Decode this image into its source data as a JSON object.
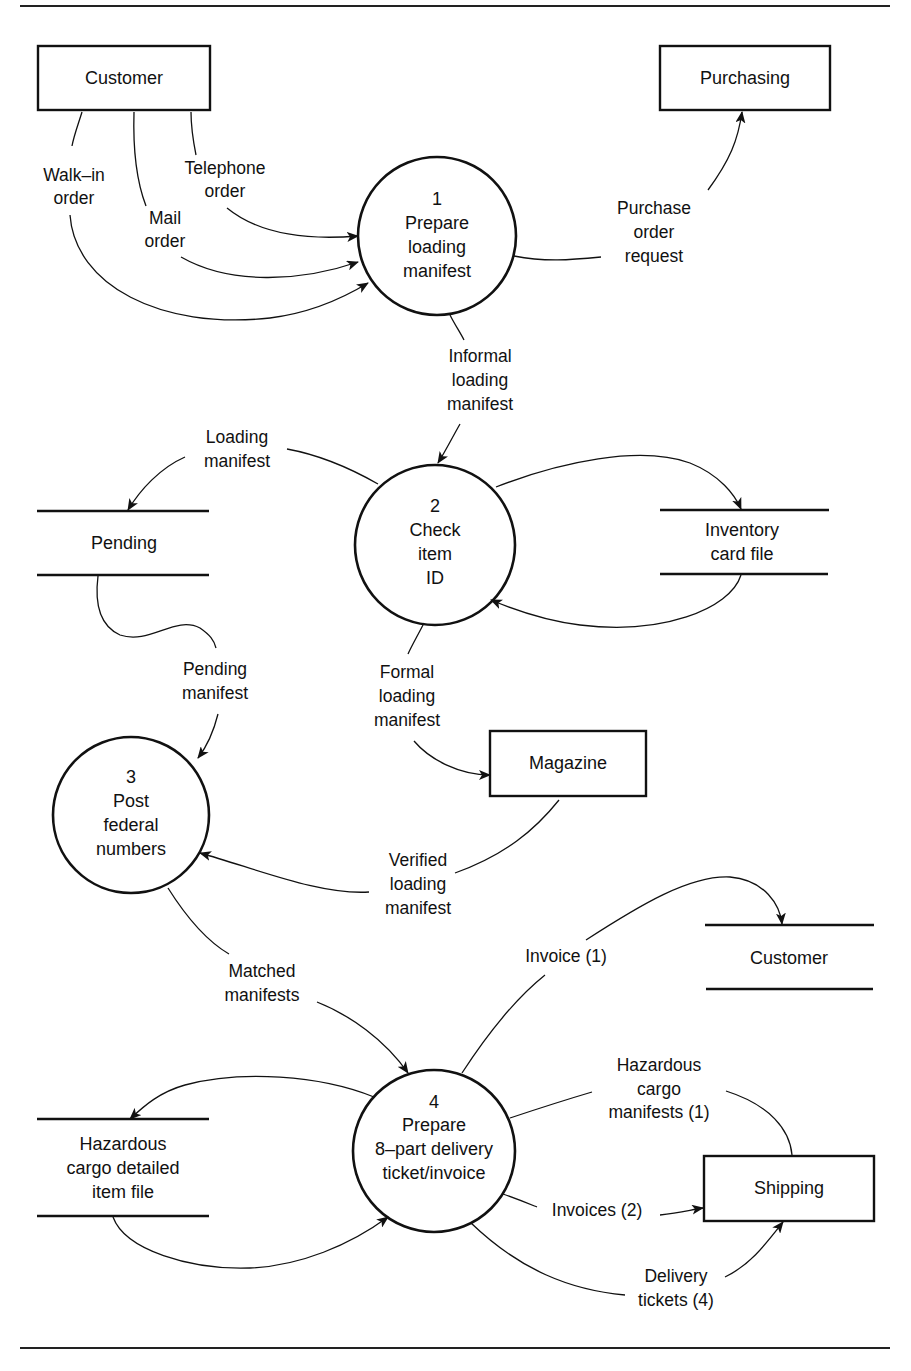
{
  "diagram": {
    "type": "data-flow-diagram",
    "external_entities": [
      {
        "id": "customer_entity",
        "label": "Customer"
      },
      {
        "id": "purchasing",
        "label": "Purchasing"
      },
      {
        "id": "magazine",
        "label": "Magazine"
      },
      {
        "id": "shipping",
        "label": "Shipping"
      }
    ],
    "processes": [
      {
        "id": "p1",
        "number": "1",
        "lines": [
          "Prepare",
          "loading",
          "manifest"
        ]
      },
      {
        "id": "p2",
        "number": "2",
        "lines": [
          "Check",
          "item",
          "ID"
        ]
      },
      {
        "id": "p3",
        "number": "3",
        "lines": [
          "Post",
          "federal",
          "numbers"
        ]
      },
      {
        "id": "p4",
        "number": "4",
        "lines": [
          "Prepare",
          "8–part delivery",
          "ticket/invoice"
        ]
      }
    ],
    "data_stores": [
      {
        "id": "pending",
        "lines": [
          "Pending"
        ]
      },
      {
        "id": "inventory",
        "lines": [
          "Inventory",
          "card file"
        ]
      },
      {
        "id": "customer_store",
        "lines": [
          "Customer"
        ]
      },
      {
        "id": "hazardous",
        "lines": [
          "Hazardous",
          "cargo detailed",
          "item file"
        ]
      }
    ],
    "flows": [
      {
        "id": "walkin",
        "from": "customer_entity",
        "to": "p1",
        "lines": [
          "Walk–in",
          "order"
        ]
      },
      {
        "id": "mail",
        "from": "customer_entity",
        "to": "p1",
        "lines": [
          "Mail",
          "order"
        ]
      },
      {
        "id": "telephone",
        "from": "customer_entity",
        "to": "p1",
        "lines": [
          "Telephone",
          "order"
        ]
      },
      {
        "id": "purchase_req",
        "from": "p1",
        "to": "purchasing",
        "lines": [
          "Purchase",
          "order",
          "request"
        ]
      },
      {
        "id": "informal",
        "from": "p1",
        "to": "p2",
        "lines": [
          "Informal",
          "loading",
          "manifest"
        ]
      },
      {
        "id": "loading",
        "from": "p2",
        "to": "pending",
        "lines": [
          "Loading",
          "manifest"
        ]
      },
      {
        "id": "inv_out",
        "from": "p2",
        "to": "inventory",
        "lines": []
      },
      {
        "id": "inv_in",
        "from": "inventory",
        "to": "p2",
        "lines": []
      },
      {
        "id": "pending_manifest",
        "from": "pending",
        "to": "p3",
        "lines": [
          "Pending",
          "manifest"
        ]
      },
      {
        "id": "formal",
        "from": "p2",
        "to": "magazine",
        "lines": [
          "Formal",
          "loading",
          "manifest"
        ]
      },
      {
        "id": "verified",
        "from": "magazine",
        "to": "p3",
        "lines": [
          "Verified",
          "loading",
          "manifest"
        ]
      },
      {
        "id": "matched",
        "from": "p3",
        "to": "p4",
        "lines": [
          "Matched",
          "manifests"
        ]
      },
      {
        "id": "invoice1",
        "from": "p4",
        "to": "customer_store",
        "lines": [
          "Invoice (1)"
        ]
      },
      {
        "id": "haz_manifests",
        "from": "p4",
        "to": "shipping",
        "lines": [
          "Hazardous",
          "cargo",
          "manifests (1)"
        ]
      },
      {
        "id": "invoices2",
        "from": "p4",
        "to": "shipping",
        "lines": [
          "Invoices (2)"
        ]
      },
      {
        "id": "delivery",
        "from": "p4",
        "to": "shipping",
        "lines": [
          "Delivery",
          "tickets (4)"
        ]
      },
      {
        "id": "haz_out",
        "from": "p4",
        "to": "hazardous",
        "lines": []
      },
      {
        "id": "haz_in",
        "from": "hazardous",
        "to": "p4",
        "lines": []
      }
    ]
  },
  "colors": {
    "ink": "#111111",
    "paper": "#ffffff"
  }
}
